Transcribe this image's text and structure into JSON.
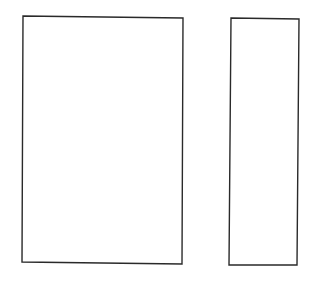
{
  "diagram": {
    "background": "#ffffff",
    "stroke_color": "#2a2a2a",
    "stroke_width": 1.4,
    "shapes": [
      {
        "id": "left-panel",
        "type": "quadrilateral",
        "points": [
          [
            23,
            16
          ],
          [
            183,
            18
          ],
          [
            182,
            264
          ],
          [
            22,
            262
          ]
        ]
      },
      {
        "id": "right-panel",
        "type": "quadrilateral",
        "points": [
          [
            231,
            18
          ],
          [
            299,
            19
          ],
          [
            297,
            265
          ],
          [
            229,
            265
          ]
        ]
      }
    ]
  }
}
